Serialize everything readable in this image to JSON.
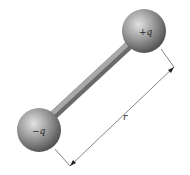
{
  "diagram": {
    "type": "electric-dipole",
    "positive_charge": {
      "label": "+q",
      "center": [
        144,
        31
      ],
      "radius": 22
    },
    "negative_charge": {
      "label": "−q",
      "center": [
        39,
        130
      ],
      "radius": 22
    },
    "separation": {
      "label": "r"
    },
    "colors": {
      "sphere_light": "#d8d8d8",
      "sphere_mid": "#9a9a9a",
      "sphere_dark": "#555555",
      "rod": "#8a8a8a",
      "line": "#333333"
    }
  }
}
